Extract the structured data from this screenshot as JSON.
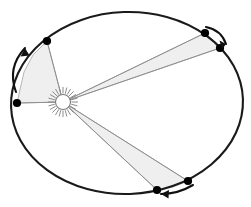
{
  "figure": {
    "background_color": "#ffffff"
  },
  "colors": {
    "orbit_stroke": "#1a1a1a",
    "sector_fill": "#efefef",
    "sector_stroke": "#9a9a9a",
    "radius_stroke": "#8e8e8e",
    "dot_fill": "#000000",
    "arrow_stroke": "#111111",
    "sun_ray": "#8c8c8c",
    "sun_fill": "#ffffff",
    "sun_stroke": "#7d7d7d"
  },
  "orbit": {
    "label": "elliptical-orbit",
    "center_x": 127,
    "center_y": 103,
    "radius_x": 116,
    "radius_y": 91,
    "rotation_deg": -2,
    "stroke_width": 2.1
  },
  "sun": {
    "label": "Sun",
    "x": 63,
    "y": 102,
    "core_radius": 7.5,
    "ray_count": 24,
    "ray_inner": 8.5,
    "ray_outer": 15
  },
  "sectors": [
    {
      "name": "sector-upper-left",
      "label": "Equal area swept near aphelion (left)",
      "points": "63,102 17,103 24,72 33,55 47,41"
    },
    {
      "name": "sector-upper-right",
      "label": "Equal area swept near perihelion (upper right)",
      "points": "63,102 205,33 213,40 220,48"
    },
    {
      "name": "sector-lower-right",
      "label": "Equal area swept near perihelion (lower right)",
      "points": "63,102 157,190 173,187 188,181"
    }
  ],
  "radii": [
    {
      "name": "radius-to-aphelion-left",
      "x1": 63,
      "y1": 102,
      "x2": 17,
      "y2": 103
    },
    {
      "name": "radius-to-upper-left-planet",
      "x1": 63,
      "y1": 102,
      "x2": 47,
      "y2": 41
    },
    {
      "name": "radius-to-upper-right-planet-a",
      "x1": 63,
      "y1": 102,
      "x2": 205,
      "y2": 33
    },
    {
      "name": "radius-to-upper-right-planet-b",
      "x1": 63,
      "y1": 102,
      "x2": 220,
      "y2": 48
    },
    {
      "name": "radius-to-lower-right-planet-a",
      "x1": 63,
      "y1": 102,
      "x2": 157,
      "y2": 190
    },
    {
      "name": "radius-to-lower-right-planet-b",
      "x1": 63,
      "y1": 102,
      "x2": 188,
      "y2": 181
    }
  ],
  "planet_positions": [
    {
      "name": "planet-dot-upper-left",
      "x": 47,
      "y": 41,
      "r": 4.1
    },
    {
      "name": "planet-dot-left",
      "x": 17,
      "y": 103,
      "r": 4.1
    },
    {
      "name": "planet-dot-upper-right-leading",
      "x": 205,
      "y": 33,
      "r": 4.1
    },
    {
      "name": "planet-dot-upper-right-trailing",
      "x": 220,
      "y": 48,
      "r": 4.1
    },
    {
      "name": "planet-dot-lower-right-trailing",
      "x": 157,
      "y": 190,
      "r": 4.1
    },
    {
      "name": "planet-dot-lower-right-leading",
      "x": 188,
      "y": 181,
      "r": 4.1
    }
  ],
  "motion_arrows": [
    {
      "name": "motion-arrow-left",
      "direction": "counterclockwise-upward",
      "path": "M 16 92 C 10 76 12 62 25 48",
      "head": "25,48 20.5,56.5 29.5,55.5"
    },
    {
      "name": "motion-arrow-upper-right",
      "direction": "clockwise-downward",
      "path": "M 206 27 C 216 29 223 35 226 44",
      "head": "226,44 219.5,40.5 222,49.5"
    },
    {
      "name": "motion-arrow-lower-right",
      "direction": "leftward",
      "path": "M 193 185 C 183 191 172 194 161 194",
      "head": "161,194 169,190 168.5,198.5"
    }
  ]
}
